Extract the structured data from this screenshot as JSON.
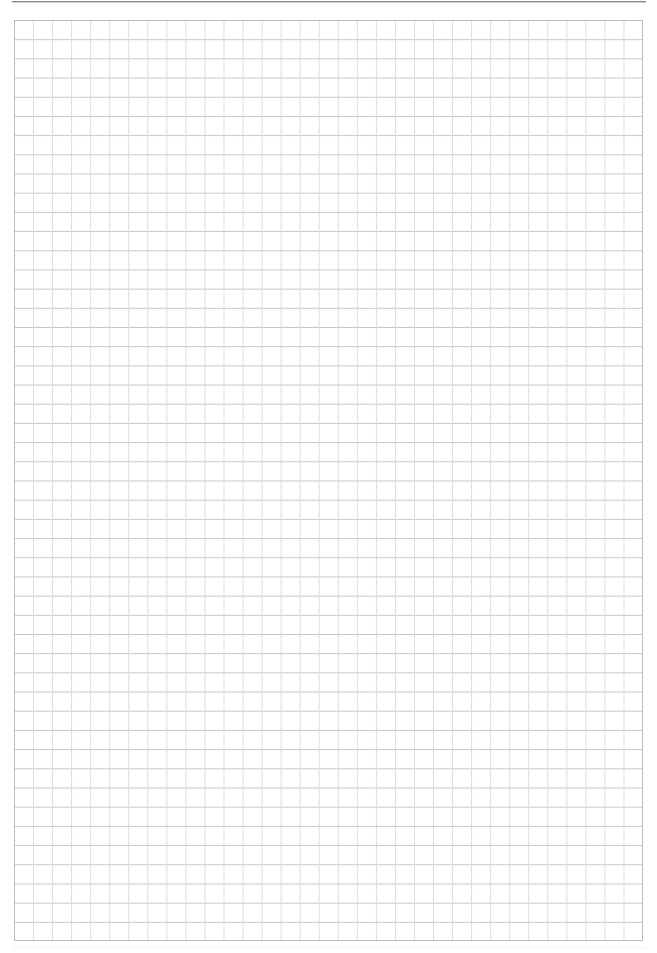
{
  "page": {
    "type": "graph-paper",
    "background_color": "#ffffff",
    "grid": {
      "columns": 33,
      "rows": 48,
      "cell_width_px": 19.06,
      "cell_height_px": 19.19,
      "line_color_horizontal": "#c6c6c6",
      "line_color_vertical": "#dcdcdc",
      "border_color": "#bdbdbd"
    },
    "header_rule_color": "#8a8a8a"
  }
}
